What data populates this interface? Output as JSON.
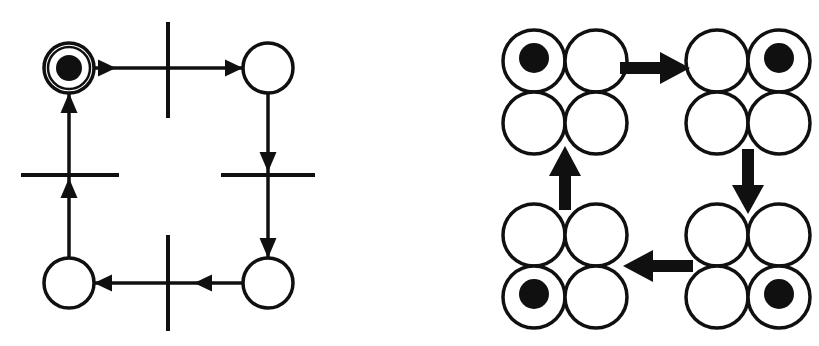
{
  "figure": {
    "background_color": "#ffffff",
    "ink_color": "#101010",
    "width": 819,
    "height": 346
  },
  "petri_net": {
    "label": "petri-net-diagram",
    "description": "Cyclic Petri net with four places and four transitions; a single token resides in the upper-left place.",
    "place_radius_outer": 25,
    "place_radius_inner": 21,
    "token_radius": 13,
    "places": [
      {
        "id": "p1",
        "name": "place-top-left",
        "cx": 69,
        "cy": 68,
        "tokens": 1,
        "double_ring": true
      },
      {
        "id": "p2",
        "name": "place-top-right",
        "cx": 268,
        "cy": 68,
        "tokens": 0,
        "double_ring": false
      },
      {
        "id": "p3",
        "name": "place-bottom-right",
        "cx": 268,
        "cy": 283,
        "tokens": 0,
        "double_ring": false
      },
      {
        "id": "p4",
        "name": "place-bottom-left",
        "cx": 69,
        "cy": 283,
        "tokens": 0,
        "double_ring": false
      }
    ],
    "transitions": [
      {
        "id": "t1",
        "name": "transition-top",
        "orientation": "vertical",
        "x": 168,
        "y": 70,
        "length": 96,
        "thickness": 4
      },
      {
        "id": "t2",
        "name": "transition-right",
        "orientation": "horizontal",
        "x": 268,
        "y": 175,
        "length": 94,
        "thickness": 4
      },
      {
        "id": "t3",
        "name": "transition-bottom",
        "orientation": "vertical",
        "x": 168,
        "y": 283,
        "length": 96,
        "thickness": 4
      },
      {
        "id": "t4",
        "name": "transition-left",
        "orientation": "horizontal",
        "x": 70,
        "y": 175,
        "length": 98,
        "thickness": 4
      }
    ],
    "arcs": [
      {
        "id": "a1",
        "name": "arc-place-top-left-to-transition-top",
        "from": "p1",
        "to": "t1",
        "direction": "right"
      },
      {
        "id": "a2",
        "name": "arc-transition-top-to-place-top-right",
        "from": "t1",
        "to": "p2",
        "direction": "right"
      },
      {
        "id": "a3",
        "name": "arc-place-top-right-to-transition-right",
        "from": "p2",
        "to": "t2",
        "direction": "down"
      },
      {
        "id": "a4",
        "name": "arc-transition-right-to-place-bottom-right",
        "from": "t2",
        "to": "p3",
        "direction": "down"
      },
      {
        "id": "a5",
        "name": "arc-place-bottom-right-to-transition-bottom",
        "from": "p3",
        "to": "t3",
        "direction": "left"
      },
      {
        "id": "a6",
        "name": "arc-transition-bottom-to-place-bottom-left",
        "from": "t3",
        "to": "p4",
        "direction": "left"
      },
      {
        "id": "a7",
        "name": "arc-place-bottom-left-to-transition-left",
        "from": "p4",
        "to": "t4",
        "direction": "up"
      },
      {
        "id": "a8",
        "name": "arc-transition-left-to-place-top-left",
        "from": "t4",
        "to": "p1",
        "direction": "up"
      }
    ]
  },
  "reachability_graph": {
    "label": "reachability-graph-diagram",
    "description": "Four markings arranged in a cycle; each marking shows the four places as a 2x2 cluster of circles with the token in one of them.",
    "node_circle_radius": 31,
    "node_token_radius": 15,
    "markings": [
      {
        "id": "m1",
        "name": "marking-top-left",
        "cx": 565,
        "cy": 92,
        "token_position": "top-left",
        "token_index": 0,
        "circle_labels": [
          "top-left",
          "top-right",
          "bottom-left",
          "bottom-right"
        ]
      },
      {
        "id": "m2",
        "name": "marking-top-right",
        "cx": 748,
        "cy": 92,
        "token_position": "top-right",
        "token_index": 1,
        "circle_labels": [
          "top-left",
          "top-right",
          "bottom-left",
          "bottom-right"
        ]
      },
      {
        "id": "m3",
        "name": "marking-bottom-right",
        "cx": 748,
        "cy": 266,
        "token_position": "bottom-right",
        "token_index": 3,
        "circle_labels": [
          "top-left",
          "top-right",
          "bottom-left",
          "bottom-right"
        ]
      },
      {
        "id": "m4",
        "name": "marking-bottom-left",
        "cx": 565,
        "cy": 266,
        "token_position": "bottom-left",
        "token_index": 2,
        "circle_labels": [
          "top-left",
          "top-right",
          "bottom-left",
          "bottom-right"
        ]
      }
    ],
    "edges": [
      {
        "id": "e1",
        "name": "edge-top-left-to-top-right",
        "from": "m1",
        "to": "m2",
        "direction": "right"
      },
      {
        "id": "e2",
        "name": "edge-top-right-to-bottom-right",
        "from": "m2",
        "to": "m3",
        "direction": "down"
      },
      {
        "id": "e3",
        "name": "edge-bottom-right-to-bottom-left",
        "from": "m3",
        "to": "m4",
        "direction": "left"
      },
      {
        "id": "e4",
        "name": "edge-bottom-left-to-top-left",
        "from": "m4",
        "to": "m1",
        "direction": "up"
      }
    ]
  }
}
